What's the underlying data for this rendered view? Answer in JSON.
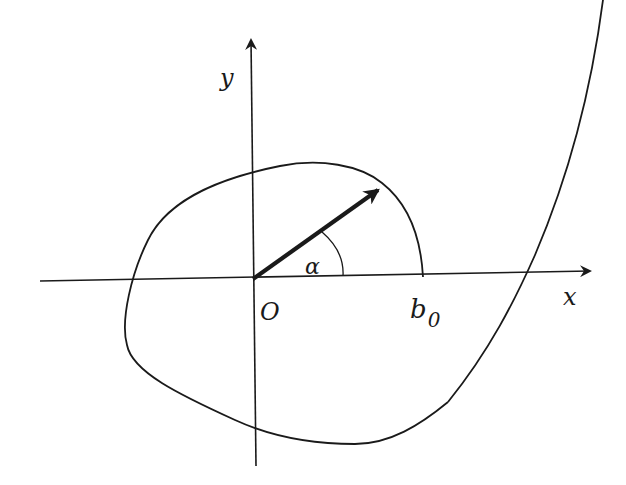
{
  "diagram": {
    "labels": {
      "y_axis": "y",
      "x_axis": "x",
      "origin": "O",
      "angle": "α",
      "b_main": "b",
      "b_sub": "0"
    },
    "colors": {
      "stroke": "#1a1a1a",
      "background": "#ffffff"
    }
  }
}
